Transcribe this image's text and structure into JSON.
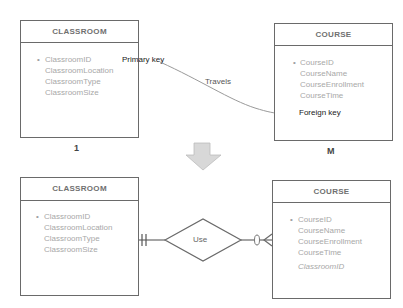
{
  "top": {
    "classroom": {
      "title": "CLASSROOM",
      "attributes": [
        "ClassroomID",
        "ClassroomLocation",
        "ClassroomType",
        "ClassroomSize"
      ],
      "cardinality": "1"
    },
    "course": {
      "title": "COURSE",
      "attributes": [
        "CourseID",
        "CourseName",
        "CourseEnrollment",
        "CourseTime"
      ],
      "cardinality": "M"
    },
    "annotations": {
      "primary_key": "Primary key",
      "travels": "Travels",
      "foreign_key": "Foreign key"
    }
  },
  "transition_icon": "down-arrow-icon",
  "bottom": {
    "classroom": {
      "title": "CLASSROOM",
      "attributes": [
        "ClassroomID",
        "ClassroomLocation",
        "ClassroomType",
        "ClassroomSize"
      ]
    },
    "relationship": {
      "label": "Use"
    },
    "course": {
      "title": "COURSE",
      "attributes": [
        "CourseID",
        "CourseName",
        "CourseEnrollment",
        "CourseTime"
      ],
      "foreign_key_attribute": "ClassroomID"
    }
  },
  "colors": {
    "border": "#6a6a6a",
    "attribute_text": "#a8a8a8",
    "label_text": "#333333",
    "arrow_fill": "#d8d8d8"
  }
}
